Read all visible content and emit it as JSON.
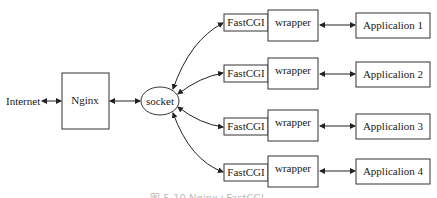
{
  "diagram": {
    "internet_label": "Internet",
    "nginx_label": "Nginx",
    "socket_label": "socket",
    "rows": [
      {
        "fastcgi": "FastCGI",
        "wrapper": "wrapper",
        "app": "Applicalion 1"
      },
      {
        "fastcgi": "FastCGI",
        "wrapper": "wrapper",
        "app": "Applicalion 2"
      },
      {
        "fastcgi": "FastCGI",
        "wrapper": "wrapper",
        "app": "Applicalion 3"
      },
      {
        "fastcgi": "FastCGI",
        "wrapper": "wrapper",
        "app": "Applicalion 4"
      }
    ],
    "caption": "图 5-10  Nginx+FastCGI"
  }
}
